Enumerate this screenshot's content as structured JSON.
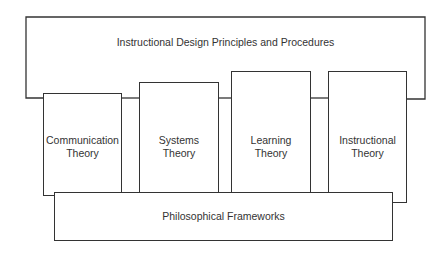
{
  "diagram": {
    "top": {
      "label": "Instructional Design Principles and Procedures"
    },
    "columns": [
      {
        "line1": "Communication",
        "line2": "Theory"
      },
      {
        "line1": "Systems",
        "line2": "Theory"
      },
      {
        "line1": "Learning",
        "line2": "Theory"
      },
      {
        "line1": "Instructional",
        "line2": "Theory"
      }
    ],
    "base": {
      "label": "Philosophical Frameworks"
    },
    "colors": {
      "stroke": "#333333",
      "background": "#ffffff",
      "text": "#333333"
    }
  }
}
